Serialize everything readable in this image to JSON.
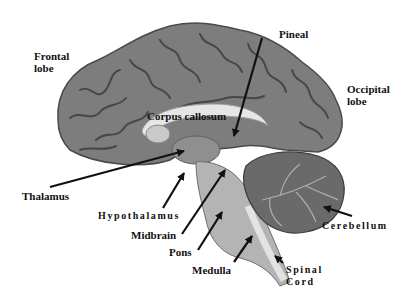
{
  "diagram": {
    "labels": {
      "frontal_lobe_line1": "Frontal",
      "frontal_lobe_line2": "lobe",
      "pineal": "Pineal",
      "occipital_lobe_line1": "Occipital",
      "occipital_lobe_line2": "lobe",
      "corpus_callosum": "Corpus callosum",
      "thalamus": "Thalamus",
      "hypothalamus": "Hypothalamus",
      "midbrain": "Midbrain",
      "pons": "Pons",
      "medulla": "Medulla",
      "cerebellum": "Cerebellum",
      "spinal_cord_line1": "Spinal",
      "spinal_cord_line2": "Cord"
    },
    "colors": {
      "cortex": "#7d7d7d",
      "sulci": "#3e3e3e",
      "white_matter": "#c9c9c9",
      "corpus_callosum": "#e6e6e6",
      "brainstem": "#b4b4b4",
      "cerebellum": "#6a6a6a",
      "arrow": "#111111",
      "label": "#111111"
    }
  }
}
